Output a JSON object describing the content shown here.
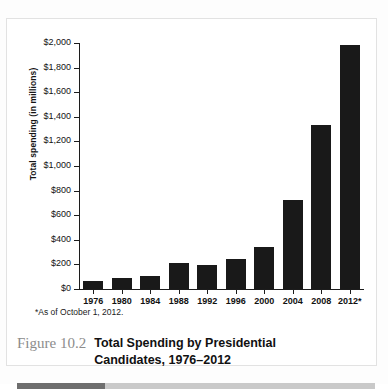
{
  "figure": {
    "number_label": "Figure 10.2",
    "title_line1": "Total Spending by Presidential",
    "title_line2": "Candidates, 1976–2012",
    "footnote": "*As of October 1, 2012."
  },
  "colors": {
    "bar": "#191919",
    "axis": "#1c1c1c",
    "figure_number": "#8c8c8c",
    "rule_dark": "#6e6e6e",
    "rule_light": "#c9c9c9",
    "frame": "#e2e2e2"
  },
  "chart_data": {
    "type": "bar",
    "title": "Total Spending by Presidential Candidates, 1976–2012",
    "xlabel": "",
    "ylabel": "Total spending (in millions)",
    "categories": [
      "1976",
      "1980",
      "1984",
      "1988",
      "1992",
      "1996",
      "2000",
      "2004",
      "2008",
      "2012*"
    ],
    "values": [
      65,
      92,
      105,
      212,
      192,
      240,
      345,
      720,
      1330,
      1980
    ],
    "ylim": [
      0,
      2000
    ],
    "ytick_values": [
      0,
      200,
      400,
      600,
      800,
      1000,
      1200,
      1400,
      1600,
      1800,
      2000
    ],
    "ytick_labels": [
      "$0",
      "$200",
      "$400",
      "$600",
      "$800",
      "$1,000",
      "$1,200",
      "$1,400",
      "$1,600",
      "$1,800",
      "$2,000"
    ],
    "grid": false,
    "legend": null,
    "annotations": [
      "*As of October 1, 2012."
    ]
  }
}
